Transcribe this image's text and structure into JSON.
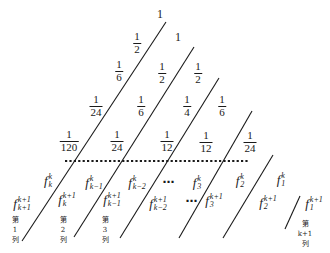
{
  "diagram": {
    "colors": {
      "ink": "#1a1a1a",
      "background": "#ffffff"
    },
    "triangle_rows": [
      [
        {
          "type": "integer",
          "text": "1"
        }
      ],
      [
        {
          "type": "fraction",
          "num": "1",
          "den": "2"
        },
        {
          "type": "integer",
          "text": "1"
        }
      ],
      [
        {
          "type": "fraction",
          "num": "1",
          "den": "6"
        },
        {
          "type": "fraction",
          "num": "1",
          "den": "2"
        },
        {
          "type": "fraction",
          "num": "1",
          "den": "2"
        }
      ],
      [
        {
          "type": "fraction",
          "num": "1",
          "den": "24"
        },
        {
          "type": "fraction",
          "num": "1",
          "den": "6"
        },
        {
          "type": "fraction",
          "num": "1",
          "den": "4"
        },
        {
          "type": "fraction",
          "num": "1",
          "den": "6"
        }
      ],
      [
        {
          "type": "fraction",
          "num": "1",
          "den": "120"
        },
        {
          "type": "fraction",
          "num": "1",
          "den": "24"
        },
        {
          "type": "fraction",
          "num": "1",
          "den": "12"
        },
        {
          "type": "fraction",
          "num": "1",
          "den": "12"
        },
        {
          "type": "fraction",
          "num": "1",
          "den": "24"
        }
      ]
    ],
    "row_k": [
      {
        "base": "f",
        "sup": "k",
        "sub": "k"
      },
      {
        "base": "f",
        "sup": "k",
        "sub": "k−1"
      },
      {
        "base": "f",
        "sup": "k",
        "sub": "k−2"
      },
      {
        "ellipsis": "⋯"
      },
      {
        "base": "f",
        "sup": "k",
        "sub": "3"
      },
      {
        "base": "f",
        "sup": "k",
        "sub": "2"
      },
      {
        "base": "f",
        "sup": "k",
        "sub": "1"
      }
    ],
    "row_k1": [
      {
        "base": "f",
        "sup": "k+1",
        "sub": "k+1"
      },
      {
        "base": "f",
        "sup": "k+1",
        "sub": "k"
      },
      {
        "base": "f",
        "sup": "k+1",
        "sub": "k−1"
      },
      {
        "base": "f",
        "sup": "k+1",
        "sub": "k−2"
      },
      {
        "ellipsis": "⋯"
      },
      {
        "base": "f",
        "sup": "k+1",
        "sub": "3"
      },
      {
        "base": "f",
        "sup": "k+1",
        "sub": "2"
      },
      {
        "base": "f",
        "sup": "k+1",
        "sub": "1"
      }
    ],
    "column_labels": [
      {
        "prefix": "第",
        "index": "1",
        "suffix": "列"
      },
      {
        "prefix": "第",
        "index": "2",
        "suffix": "列"
      },
      {
        "prefix": "第",
        "index": "3",
        "suffix": "列"
      },
      {
        "prefix": "第",
        "index": "k+1",
        "suffix": "列"
      }
    ]
  }
}
